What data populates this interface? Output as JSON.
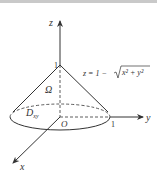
{
  "figure": {
    "axes": {
      "x_label": "x",
      "y_label": "y",
      "z_label": "z",
      "origin_label": "O"
    },
    "ticks": {
      "z_tick": "1",
      "y_tick": "1"
    },
    "region_label": "Ω",
    "domain_label_main": "D",
    "domain_label_sub": "xy",
    "surface_equation": {
      "lhs": "z = 1 − ",
      "radicand": "x² + y²"
    },
    "colors": {
      "stroke": "#333333",
      "background": "#ffffff",
      "topbar": "#c9c9c9"
    }
  }
}
